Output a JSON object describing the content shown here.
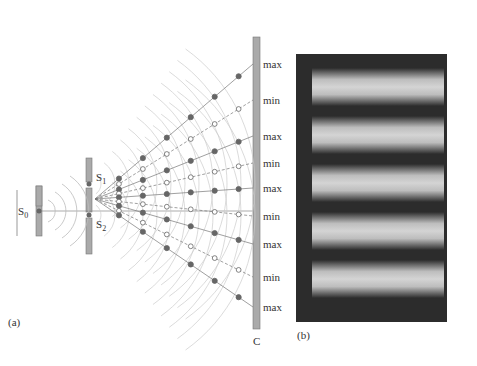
{
  "panel_a": {
    "label": "(a)",
    "source_label": "S",
    "source_sub": "0",
    "slit1_label": "S",
    "slit1_sub": "1",
    "slit2_label": "S",
    "slit2_sub": "2",
    "screen_label": "C",
    "screen_labels": [
      "max",
      "min",
      "max",
      "min",
      "max",
      "min",
      "max",
      "min",
      "max"
    ]
  },
  "panel_b": {
    "label": "(b)",
    "bright_fringes": 5
  }
}
